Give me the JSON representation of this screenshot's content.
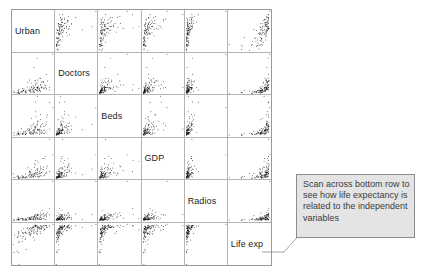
{
  "figure": {
    "type": "scatterplot-matrix",
    "variables": [
      "Urban",
      "Doctors",
      "Beds",
      "GDP",
      "Radios",
      "Life exp"
    ],
    "n_points": 110,
    "grid": {
      "rows": 6,
      "cols": 6,
      "gridlines": true
    },
    "colors": {
      "point": "#111111",
      "gridline": "#b4b4b4",
      "border": "#9a9a9a",
      "background": "#ffffff",
      "label_text": "#242424",
      "callout_fill": "#e4e4e4",
      "callout_border": "#8d8d8d",
      "callout_text": "#3c3c3c"
    }
  },
  "diagonal_labels": [
    {
      "index": 0,
      "label": "Urban"
    },
    {
      "index": 1,
      "label": "Doctors"
    },
    {
      "index": 2,
      "label": "Beds"
    },
    {
      "index": 3,
      "label": "GDP"
    },
    {
      "index": 4,
      "label": "Radios"
    },
    {
      "index": 5,
      "label": "Life exp"
    }
  ],
  "callout": {
    "text": "Scan across bottom row to see how life expectancy is related to the independent variables",
    "target": "Life exp"
  },
  "chart_data": {
    "type": "scatter",
    "title": "",
    "xlabel": "",
    "ylabel": "",
    "variables": [
      "Urban",
      "Doctors",
      "Beds",
      "GDP",
      "Radios",
      "Life exp"
    ],
    "matrix_layout": "6x6 scatterplot matrix; diagonal cells hold the variable name, off-diagonal cells plot column-variable (x) against row-variable (y)",
    "n_points": 110,
    "distributions": {
      "Urban": {
        "skew": 0.15,
        "note": "percent urban population, broadly spread"
      },
      "Doctors": {
        "skew": 1.9,
        "note": "doctors per capita, strongly right-skewed, dense near zero"
      },
      "Beds": {
        "skew": 1.5,
        "note": "hospital beds per capita, right-skewed"
      },
      "GDP": {
        "skew": 2.2,
        "note": "GDP per capita, strongly right-skewed"
      },
      "Radios": {
        "skew": 2.0,
        "note": "radios per capita, strongly right-skewed"
      },
      "Life exp": {
        "skew": -0.8,
        "note": "life expectancy, left-skewed, ceiling near upper values"
      }
    },
    "correlations": [
      [
        1.0,
        0.62,
        0.55,
        0.66,
        0.6,
        0.72
      ],
      [
        0.62,
        1.0,
        0.58,
        0.64,
        0.58,
        0.74
      ],
      [
        0.55,
        0.58,
        1.0,
        0.57,
        0.52,
        0.66
      ],
      [
        0.66,
        0.64,
        0.57,
        1.0,
        0.7,
        0.64
      ],
      [
        0.6,
        0.58,
        0.52,
        0.7,
        1.0,
        0.62
      ],
      [
        0.72,
        0.74,
        0.66,
        0.64,
        0.62,
        1.0
      ]
    ],
    "relationship_notes": [
      "Bottom row: Life exp rises steeply then plateaus against each independent variable (log-like saturation).",
      "Right column: each independent variable increases sharply at high Life exp.",
      "Doctors, GDP and Radios cluster densely at low values with a long upper tail.",
      "All pairs show positive association."
    ],
    "legend": {
      "entries": [],
      "position": "none"
    },
    "axis_ticks": {
      "shown": false
    },
    "point_marker": {
      "shape": "circle",
      "radius_px": 0.9,
      "color": "#111111"
    }
  }
}
